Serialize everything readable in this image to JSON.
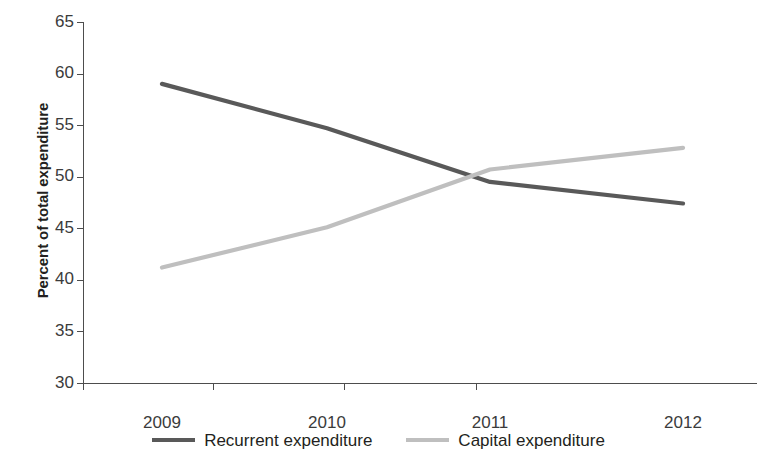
{
  "chart_data": {
    "type": "line",
    "title": "",
    "xlabel": "",
    "ylabel": "Percent of total expenditure",
    "categories": [
      "2009",
      "2010",
      "2011",
      "2012"
    ],
    "ylim": [
      30,
      65
    ],
    "yticks": [
      30,
      35,
      40,
      45,
      50,
      55,
      60,
      65
    ],
    "grid": false,
    "legend_position": "bottom",
    "series": [
      {
        "name": "Recurrent expenditure",
        "color": "#595959",
        "values": [
          59.0,
          54.7,
          49.5,
          47.4
        ]
      },
      {
        "name": "Capital expenditure",
        "color": "#bfbfbf",
        "values": [
          41.2,
          45.1,
          50.7,
          52.8
        ]
      }
    ]
  },
  "axis": {
    "y_title": "Percent of total expenditure",
    "y_tick_labels": [
      "65",
      "60",
      "55",
      "50",
      "45",
      "40",
      "35",
      "30"
    ],
    "x_tick_labels": [
      "2009",
      "2010",
      "2011",
      "2012"
    ]
  },
  "legend": {
    "items": [
      {
        "label": "Recurrent expenditure",
        "color": "#595959"
      },
      {
        "label": "Capital expenditure",
        "color": "#bfbfbf"
      }
    ]
  }
}
